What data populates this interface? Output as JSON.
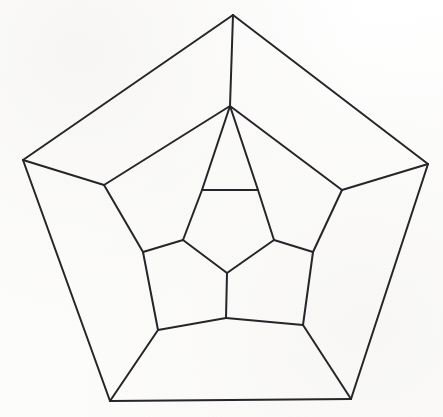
{
  "figure": {
    "canvas": {
      "width": 443,
      "height": 417
    },
    "style": {
      "background_color": "#fefefe",
      "line_color": "#25252a",
      "line_width": 2,
      "fill": "none"
    }
  },
  "chart_data": {
    "type": "diagram",
    "subtype": "planar-graph",
    "vertex_count": 20,
    "edge_count": 30,
    "face_count": 12,
    "rings": [
      {
        "name": "outer-pentagon",
        "vertex_ids": [
          0,
          1,
          2,
          3,
          4
        ]
      },
      {
        "name": "middle-outer-ring",
        "vertex_ids": [
          5,
          6,
          7,
          8,
          9
        ]
      },
      {
        "name": "middle-inner-ring",
        "vertex_ids": [
          10,
          11,
          12,
          13,
          14
        ]
      },
      {
        "name": "inner-pentagon",
        "vertex_ids": [
          15,
          16,
          17,
          18,
          19
        ]
      }
    ],
    "vertices": [
      {
        "id": 0,
        "ring": "outer-pentagon",
        "label": "top",
        "x": 233,
        "y": 15
      },
      {
        "id": 1,
        "ring": "outer-pentagon",
        "label": "right",
        "x": 428,
        "y": 164
      },
      {
        "id": 2,
        "ring": "outer-pentagon",
        "label": "bottom-right",
        "x": 351,
        "y": 399
      },
      {
        "id": 3,
        "ring": "outer-pentagon",
        "label": "bottom-left",
        "x": 110,
        "y": 401
      },
      {
        "id": 4,
        "ring": "outer-pentagon",
        "label": "left",
        "x": 23,
        "y": 160
      },
      {
        "id": 5,
        "ring": "middle-outer-ring",
        "label": "upper-left",
        "x": 104,
        "y": 185
      },
      {
        "id": 6,
        "ring": "middle-outer-ring",
        "label": "upper-right",
        "x": 342,
        "y": 190
      },
      {
        "id": 7,
        "ring": "middle-outer-ring",
        "label": "lower-right",
        "x": 303,
        "y": 325
      },
      {
        "id": 8,
        "ring": "middle-outer-ring",
        "label": "lower-left",
        "x": 158,
        "y": 330
      },
      {
        "id": 9,
        "ring": "middle-outer-ring",
        "label": "top-center",
        "x": 230,
        "y": 106
      },
      {
        "id": 10,
        "ring": "middle-inner-ring",
        "label": "left",
        "x": 143,
        "y": 252
      },
      {
        "id": 11,
        "ring": "middle-inner-ring",
        "label": "right",
        "x": 313,
        "y": 252
      },
      {
        "id": 12,
        "ring": "middle-inner-ring",
        "label": "bottom",
        "x": 226,
        "y": 318
      },
      {
        "id": 13,
        "ring": "middle-inner-ring",
        "label": "upper-left",
        "x": 202,
        "y": 190
      },
      {
        "id": 14,
        "ring": "middle-inner-ring",
        "label": "upper-right",
        "x": 258,
        "y": 190
      },
      {
        "id": 15,
        "ring": "inner-pentagon",
        "label": "top-left",
        "x": 202,
        "y": 190
      },
      {
        "id": 16,
        "ring": "inner-pentagon",
        "label": "top-right",
        "x": 258,
        "y": 190
      },
      {
        "id": 17,
        "ring": "inner-pentagon",
        "label": "right",
        "x": 274,
        "y": 240
      },
      {
        "id": 18,
        "ring": "inner-pentagon",
        "label": "bottom",
        "x": 227,
        "y": 273
      },
      {
        "id": 19,
        "ring": "inner-pentagon",
        "label": "left",
        "x": 183,
        "y": 240
      }
    ],
    "edges": [
      {
        "from": 0,
        "to": 1,
        "group": "outer-pentagon"
      },
      {
        "from": 1,
        "to": 2,
        "group": "outer-pentagon"
      },
      {
        "from": 2,
        "to": 3,
        "group": "outer-pentagon"
      },
      {
        "from": 3,
        "to": 4,
        "group": "outer-pentagon"
      },
      {
        "from": 4,
        "to": 0,
        "group": "outer-pentagon"
      },
      {
        "from": 0,
        "to": 9,
        "group": "spoke-outer"
      },
      {
        "from": 1,
        "to": 6,
        "group": "spoke-outer"
      },
      {
        "from": 2,
        "to": 7,
        "group": "spoke-outer"
      },
      {
        "from": 3,
        "to": 8,
        "group": "spoke-outer"
      },
      {
        "from": 4,
        "to": 5,
        "group": "spoke-outer"
      },
      {
        "from": 9,
        "to": 5,
        "group": "middle-outer-ring"
      },
      {
        "from": 5,
        "to": 10,
        "group": "middle-outer-ring"
      },
      {
        "from": 10,
        "to": 8,
        "group": "middle-outer-ring"
      },
      {
        "from": 8,
        "to": 12,
        "group": "middle-outer-ring"
      },
      {
        "from": 12,
        "to": 7,
        "group": "middle-outer-ring"
      },
      {
        "from": 7,
        "to": 11,
        "group": "middle-outer-ring"
      },
      {
        "from": 11,
        "to": 6,
        "group": "middle-outer-ring"
      },
      {
        "from": 6,
        "to": 9,
        "group": "middle-outer-ring"
      },
      {
        "from": 9,
        "to": 15,
        "group": "spoke-inner"
      },
      {
        "from": 9,
        "to": 16,
        "group": "spoke-inner"
      },
      {
        "from": 10,
        "to": 19,
        "group": "spoke-inner"
      },
      {
        "from": 11,
        "to": 17,
        "group": "spoke-inner"
      },
      {
        "from": 12,
        "to": 18,
        "group": "spoke-inner"
      },
      {
        "from": 15,
        "to": 16,
        "group": "inner-pentagon"
      },
      {
        "from": 16,
        "to": 17,
        "group": "inner-pentagon"
      },
      {
        "from": 17,
        "to": 18,
        "group": "inner-pentagon"
      },
      {
        "from": 18,
        "to": 19,
        "group": "inner-pentagon"
      },
      {
        "from": 19,
        "to": 15,
        "group": "inner-pentagon"
      }
    ],
    "paths": {
      "outer_pentagon": "M233,15 L428,164 L351,399 L110,401 L23,160 Z",
      "inner_pentagon": "M202,190 L258,190 L274,240 L227,273 L183,240 Z",
      "middle_ring": "M230,106 L104,185 L143,252 L158,330 L226,318 L303,325 L313,252 L342,190 Z",
      "spokes_outer": [
        "M233,15 L230,106",
        "M428,164 L342,190",
        "M351,399 L303,325",
        "M110,401 L158,330",
        "M23,160 L104,185"
      ],
      "spokes_inner": [
        "M230,106 L202,190",
        "M230,106 L258,190",
        "M143,252 L183,240",
        "M313,252 L274,240",
        "M226,318 L227,273"
      ]
    }
  }
}
